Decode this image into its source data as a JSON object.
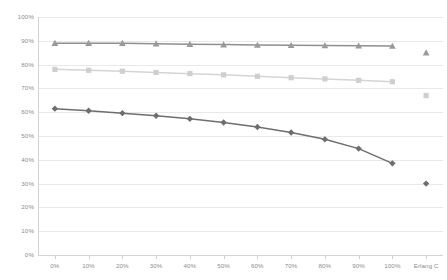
{
  "chart_data": {
    "type": "line",
    "title": "",
    "subtitle": "",
    "xlabel": "",
    "ylabel": "",
    "grid": true,
    "legend": "none",
    "ylim": [
      0,
      100
    ],
    "ytick_labels": [
      "100%",
      "90%",
      "80%",
      "70%",
      "60%",
      "50%",
      "40%",
      "30%",
      "20%",
      "10%",
      "0%"
    ],
    "ytick_values": [
      100,
      90,
      80,
      70,
      60,
      50,
      40,
      30,
      20,
      10,
      0
    ],
    "categories": [
      "0%",
      "10%",
      "20%",
      "30%",
      "40%",
      "50%",
      "60%",
      "70%",
      "80%",
      "90%",
      "100%",
      "Erlang C"
    ],
    "series": [
      {
        "name": "triangle-series",
        "marker": "triangle",
        "color": "#9a9a9a",
        "line_color": "#8f8f8f",
        "values": [
          89,
          89,
          89,
          88.8,
          88.6,
          88.4,
          88.2,
          88.1,
          88,
          87.9,
          87.8,
          null
        ],
        "final_point": 85
      },
      {
        "name": "square-series",
        "marker": "square",
        "color": "#cfcfcf",
        "line_color": "#d4d4d4",
        "values": [
          78,
          77.6,
          77.2,
          76.7,
          76.2,
          75.7,
          75.1,
          74.5,
          74,
          73.4,
          72.8,
          null
        ],
        "final_point": 67
      },
      {
        "name": "diamond-series",
        "marker": "diamond",
        "color": "#6e6e6e",
        "line_color": "#6e6e6e",
        "values": [
          61.5,
          60.6,
          59.6,
          58.5,
          57.2,
          55.7,
          53.8,
          51.5,
          48.6,
          44.7,
          38.5,
          null
        ],
        "final_point": 30
      }
    ]
  },
  "axes": {
    "y_axis_color": "#d2d2d2",
    "x_axis_color": "#d2d2d2",
    "grid_color": "#e9e9e9",
    "tick_text_color": "#8d8d8d"
  }
}
